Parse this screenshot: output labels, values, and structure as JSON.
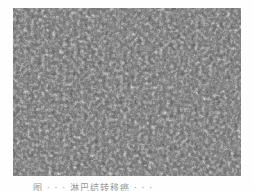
{
  "figure": {
    "type": "micrograph",
    "colors": {
      "background": "#6a6a6a",
      "dark": "#1e1e1e",
      "light": "#f0f0f0"
    }
  },
  "caption": {
    "text": "图 · · ·  淋巴结转移癌 · · ·"
  }
}
